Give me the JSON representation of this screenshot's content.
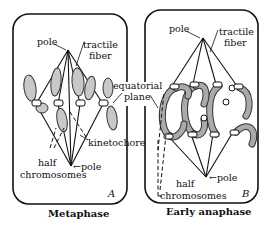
{
  "panels": [
    {
      "letter": "A",
      "caption": "Metaphase",
      "labels": {
        "pole_top": "pole",
        "tractile_1": "tractile",
        "tractile_2": "fiber",
        "kinetochore": "kinetochore",
        "half_1": "half",
        "half_2": "chromosomes",
        "pole_bottom": "←pole"
      }
    },
    {
      "letter": "B",
      "caption": "Early anaphase",
      "labels": {
        "pole_top": "pole",
        "tractile_1": "tractile",
        "tractile_2": "fiber",
        "half_1": "half",
        "half_2": "chromosomes",
        "pole_bottom": "←pole"
      }
    }
  ],
  "shared": {
    "equatorial_1": "equatorial",
    "equatorial_2": "plane"
  }
}
